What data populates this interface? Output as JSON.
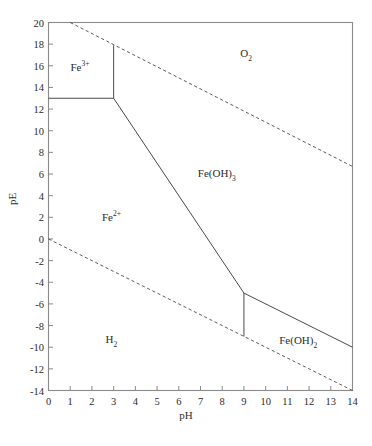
{
  "chart_data": {
    "type": "line",
    "title": "",
    "subtitle": "",
    "xlabel": "pH",
    "ylabel": "pE",
    "xlim": [
      0,
      14
    ],
    "ylim": [
      -14,
      20
    ],
    "xticks": [
      0,
      1,
      2,
      3,
      4,
      5,
      6,
      7,
      8,
      9,
      10,
      11,
      12,
      13,
      14
    ],
    "yticks": [
      -14,
      -12,
      -10,
      -8,
      -6,
      -4,
      -2,
      0,
      2,
      4,
      6,
      8,
      10,
      12,
      14,
      16,
      18,
      20
    ],
    "xtick_labels": [
      "0",
      "1",
      "2",
      "3",
      "4",
      "5",
      "6",
      "7",
      "8",
      "9",
      "10",
      "11",
      "12",
      "13",
      "14"
    ],
    "ytick_labels": [
      "-14",
      "-12",
      "-10",
      "-8",
      "-6",
      "-4",
      "-2",
      "0",
      "2",
      "4",
      "6",
      "8",
      "10",
      "12",
      "14",
      "16",
      "18",
      "20"
    ],
    "grid": false,
    "legend": "none",
    "line_color": "#4a4a4a",
    "frame_color": "#8a8a8a",
    "series": [
      {
        "name": "O2/H2O stability boundary",
        "style": "dashed",
        "points": [
          [
            1.0,
            20.0
          ],
          [
            14.0,
            6.7
          ]
        ]
      },
      {
        "name": "H2O/H2 stability boundary",
        "style": "dashed",
        "points": [
          [
            0.0,
            0.0
          ],
          [
            14.0,
            -14.0
          ]
        ]
      },
      {
        "name": "Fe3+/Fe2+ boundary",
        "style": "solid",
        "points": [
          [
            0.0,
            13.0
          ],
          [
            3.0,
            13.0
          ]
        ]
      },
      {
        "name": "Fe3+/Fe(OH)3 boundary",
        "style": "solid",
        "points": [
          [
            3.0,
            17.9
          ],
          [
            3.0,
            13.0
          ]
        ]
      },
      {
        "name": "Fe2+/Fe(OH)3 boundary",
        "style": "solid",
        "points": [
          [
            3.0,
            13.0
          ],
          [
            9.0,
            -5.0
          ]
        ]
      },
      {
        "name": "Fe2+/Fe(OH)2 boundary",
        "style": "solid",
        "points": [
          [
            9.0,
            -5.0
          ],
          [
            9.0,
            -9.0
          ]
        ]
      },
      {
        "name": "Fe(OH)3/Fe(OH)2 boundary",
        "style": "solid",
        "points": [
          [
            9.0,
            -5.0
          ],
          [
            14.0,
            -10.0
          ]
        ]
      }
    ],
    "annotations": [
      {
        "id": "fe3",
        "text_html": "Fe<sup>3+</sup>",
        "text": "Fe3+",
        "x": 1.45,
        "y": 16.0
      },
      {
        "id": "o2",
        "text_html": "O<sub>2</sub>",
        "text": "O2",
        "x": 9.1,
        "y": 17.0
      },
      {
        "id": "feoh3",
        "text_html": "Fe(OH)<sub>3</sub>",
        "text": "Fe(OH)3",
        "x": 7.75,
        "y": 5.9
      },
      {
        "id": "fe2",
        "text_html": "Fe<sup>2+</sup>",
        "text": "Fe2+",
        "x": 2.9,
        "y": 2.1
      },
      {
        "id": "h2",
        "text_html": "H<sub>2</sub>",
        "text": "H2",
        "x": 2.9,
        "y": -9.4
      },
      {
        "id": "feoh2",
        "text_html": "Fe(OH)<sub>2</sub>",
        "text": "Fe(OH)2",
        "x": 11.5,
        "y": -9.5
      }
    ]
  }
}
